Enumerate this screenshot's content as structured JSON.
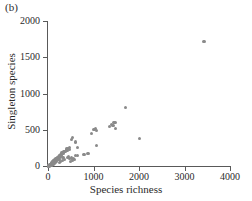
{
  "panel": {
    "label": "(b)"
  },
  "chart_data": {
    "type": "scatter",
    "title": "",
    "subtitle": "",
    "panel_label": "(b)",
    "xlabel": "Species richness",
    "ylabel": "Singleton species",
    "xlim": [
      0,
      4000
    ],
    "ylim": [
      0,
      2000
    ],
    "xticks": [
      0,
      1000,
      2000,
      3000,
      4000
    ],
    "yticks": [
      0,
      500,
      1000,
      1500,
      2000
    ],
    "xtick_labels": [
      "0",
      "1000",
      "2000",
      "3000",
      "4000"
    ],
    "ytick_labels": [
      "0",
      "500",
      "1000",
      "1500",
      "2000"
    ],
    "grid": false,
    "legend": null,
    "marker": {
      "shape": "circle",
      "color": "#8a8a8a",
      "size": 3.2
    },
    "axis_color": "#595959",
    "series": [
      {
        "name": "sites",
        "points": [
          [
            3430,
            1720
          ],
          [
            1700,
            810
          ],
          [
            1450,
            600
          ],
          [
            1490,
            595
          ],
          [
            1400,
            575
          ],
          [
            1430,
            560
          ],
          [
            1350,
            540
          ],
          [
            1480,
            515
          ],
          [
            1050,
            520
          ],
          [
            1010,
            500
          ],
          [
            1060,
            490
          ],
          [
            960,
            450
          ],
          [
            2010,
            380
          ],
          [
            530,
            390
          ],
          [
            520,
            360
          ],
          [
            610,
            330
          ],
          [
            1060,
            280
          ],
          [
            640,
            255
          ],
          [
            470,
            250
          ],
          [
            440,
            245
          ],
          [
            415,
            235
          ],
          [
            480,
            225
          ],
          [
            430,
            215
          ],
          [
            400,
            210
          ],
          [
            370,
            205
          ],
          [
            350,
            200
          ],
          [
            390,
            195
          ],
          [
            330,
            185
          ],
          [
            300,
            180
          ],
          [
            340,
            175
          ],
          [
            310,
            170
          ],
          [
            880,
            170
          ],
          [
            790,
            160
          ],
          [
            640,
            150
          ],
          [
            600,
            145
          ],
          [
            285,
            155
          ],
          [
            265,
            150
          ],
          [
            250,
            145
          ],
          [
            300,
            140
          ],
          [
            275,
            135
          ],
          [
            230,
            130
          ],
          [
            245,
            125
          ],
          [
            215,
            120
          ],
          [
            260,
            118
          ],
          [
            200,
            115
          ],
          [
            330,
            112
          ],
          [
            520,
            110
          ],
          [
            560,
            105
          ],
          [
            480,
            100
          ],
          [
            190,
            108
          ],
          [
            225,
            102
          ],
          [
            175,
            98
          ],
          [
            205,
            95
          ],
          [
            160,
            92
          ],
          [
            185,
            88
          ],
          [
            240,
            86
          ],
          [
            150,
            84
          ],
          [
            170,
            80
          ],
          [
            140,
            78
          ],
          [
            195,
            75
          ],
          [
            130,
            72
          ],
          [
            160,
            70
          ],
          [
            120,
            68
          ],
          [
            145,
            65
          ],
          [
            110,
            62
          ],
          [
            175,
            60
          ],
          [
            135,
            58
          ],
          [
            100,
            55
          ],
          [
            125,
            52
          ],
          [
            155,
            50
          ],
          [
            95,
            48
          ],
          [
            115,
            46
          ],
          [
            85,
            44
          ],
          [
            105,
            42
          ],
          [
            140,
            40
          ],
          [
            80,
            38
          ],
          [
            98,
            36
          ],
          [
            120,
            34
          ],
          [
            72,
            32
          ],
          [
            90,
            30
          ],
          [
            108,
            28
          ],
          [
            65,
            26
          ],
          [
            82,
            25
          ],
          [
            100,
            24
          ],
          [
            58,
            22
          ],
          [
            75,
            21
          ],
          [
            92,
            20
          ],
          [
            52,
            18
          ],
          [
            68,
            17
          ],
          [
            85,
            16
          ],
          [
            45,
            14
          ],
          [
            60,
            13
          ],
          [
            78,
            12
          ],
          [
            40,
            11
          ],
          [
            55,
            10
          ],
          [
            70,
            9
          ],
          [
            35,
            8
          ],
          [
            48,
            7
          ],
          [
            62,
            6
          ],
          [
            30,
            5
          ],
          [
            42,
            5
          ],
          [
            25,
            4
          ],
          [
            38,
            3
          ],
          [
            20,
            3
          ],
          [
            32,
            2
          ],
          [
            15,
            2
          ],
          [
            28,
            2
          ],
          [
            10,
            1
          ],
          [
            22,
            1
          ],
          [
            250,
            45
          ],
          [
            280,
            60
          ],
          [
            310,
            75
          ],
          [
            360,
            90
          ],
          [
            420,
            120
          ],
          [
            455,
            135
          ],
          [
            500,
            60
          ],
          [
            545,
            75
          ],
          [
            590,
            90
          ]
        ]
      }
    ]
  }
}
